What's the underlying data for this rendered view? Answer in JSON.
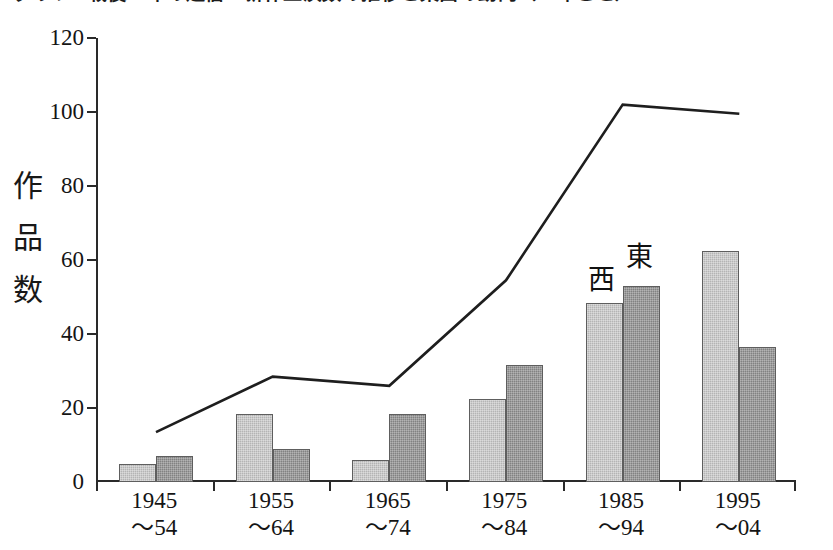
{
  "title": "グラフ1 戦後60年の通信・新作上演数の推移と東西の動向（10年ごと）",
  "axis": {
    "y_title_chars": [
      "作",
      "品",
      "数"
    ],
    "y_ticks": [
      "0",
      "20",
      "40",
      "60",
      "80",
      "100",
      "120"
    ]
  },
  "annotations": {
    "west": "西",
    "east": "東"
  },
  "x_labels": [
    {
      "line1": "1945",
      "line2": "～54"
    },
    {
      "line1": "1955",
      "line2": "～64"
    },
    {
      "line1": "1965",
      "line2": "～74"
    },
    {
      "line1": "1975",
      "line2": "～84"
    },
    {
      "line1": "1985",
      "line2": "～94"
    },
    {
      "line1": "1995",
      "line2": "～04"
    }
  ],
  "chart_data": {
    "type": "bar",
    "title": "グラフ1 戦後60年の通信・新作上演数の推移と東西の動向（10年ごと）",
    "xlabel": "",
    "ylabel": "作品数",
    "ylim": [
      0,
      120
    ],
    "yticks": [
      0,
      20,
      40,
      60,
      80,
      100,
      120
    ],
    "grid": false,
    "legend_position": "inline-annotation-above-1985-94-group",
    "categories": [
      "1945～54",
      "1955～64",
      "1965～74",
      "1975～84",
      "1985～94",
      "1995～04"
    ],
    "series": [
      {
        "name": "西",
        "type": "bar",
        "color": "#b4b4b4",
        "values": [
          5,
          18.5,
          6,
          22.5,
          48.5,
          62.5
        ]
      },
      {
        "name": "東",
        "type": "bar",
        "color": "#828282",
        "values": [
          7,
          9,
          18.5,
          31.5,
          53,
          36.5
        ]
      },
      {
        "name": "合計",
        "type": "line",
        "color": "#1e1e1e",
        "values": [
          13.5,
          28.5,
          26,
          54.5,
          102,
          99.5
        ]
      }
    ]
  }
}
